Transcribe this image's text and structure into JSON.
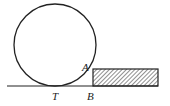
{
  "diagram": {
    "labels": {
      "A": "A",
      "T": "T",
      "B": "B"
    },
    "colors": {
      "stroke": "#222222",
      "background": "#ffffff"
    }
  }
}
